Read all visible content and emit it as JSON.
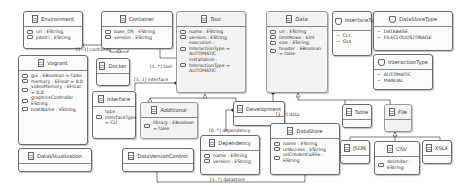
{
  "diagram": {
    "classes": {
      "environment": {
        "name": "Environment",
        "attrs": [
          "uri : EString",
          "jobUri : EString"
        ]
      },
      "container": {
        "name": "Container",
        "attrs": [
          "base_OS : EString",
          "version : EString"
        ]
      },
      "tool": {
        "name": "Tool",
        "abstract": true,
        "attrs": [
          "name : EString",
          "version : EString",
          "execution : InteractionType = AUTOMATIC",
          "installation : InteractionType = AUTOMATIC"
        ]
      },
      "data": {
        "name": "Data",
        "abstract": true,
        "attrs": [
          "uri : EString",
          "limitRows : EInt",
          "size : EString",
          "header : EBoolean = false"
        ]
      },
      "vagrant": {
        "name": "Vagrant",
        "attrs": [
          "gui : EBoolean = false",
          "memory : EFloat = 0.0",
          "videoMemory : EFloat = 0.0",
          "graphicsController : EString",
          "hostName : EString"
        ]
      },
      "docker": {
        "name": "Docker",
        "attrs": []
      },
      "interface": {
        "name": "Interface",
        "attrs": [
          "type : InterfaceType = CLI"
        ]
      },
      "additional": {
        "name": "Additional",
        "abstract": true,
        "attrs": [
          "library : EBoolean = false"
        ]
      },
      "development": {
        "name": "Development",
        "attrs": []
      },
      "dependency": {
        "name": "Dependency",
        "attrs": [
          "name : EString",
          "version : EString"
        ]
      },
      "datastore": {
        "name": "DataStore",
        "attrs": [
          "name : EString",
          "urlAccess : EString",
          "uriCredentialFile : EString"
        ]
      },
      "table": {
        "name": "Table",
        "attrs": []
      },
      "file": {
        "name": "File",
        "abstract": true,
        "attrs": []
      },
      "json": {
        "name": "JSON",
        "attrs": []
      },
      "csv": {
        "name": "CSV",
        "attrs": [
          "delimiter : EString"
        ]
      },
      "xslx": {
        "name": "XSLX",
        "attrs": []
      },
      "datavisualization": {
        "name": "DataVisualization",
        "attrs": []
      },
      "dataversioncontrol": {
        "name": "DataVersionControl",
        "attrs": []
      }
    },
    "enums": {
      "interfacetype": {
        "name": "InterfaceType",
        "literals": [
          "CLI",
          "GUI"
        ]
      },
      "datastoretype": {
        "name": "DataStoreType",
        "literals": [
          "DATABASE",
          "FILECLOUDSTORAGE"
        ]
      },
      "interactiontype": {
        "name": "InteractionType",
        "literals": [
          "AUTOMATIC",
          "MANUAL"
        ]
      }
    },
    "references": {
      "container": "[1..1] container",
      "tool": "[1..*] tool",
      "interface": "[1..1] interface",
      "dependency": "[0..*] dependency",
      "data": "[1..*] data",
      "datastore": "[1..*] datastore"
    }
  }
}
